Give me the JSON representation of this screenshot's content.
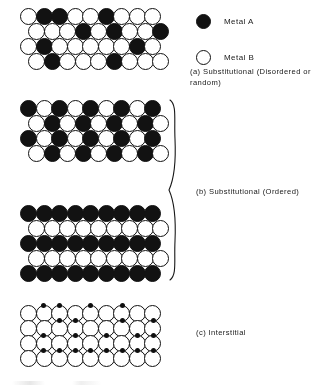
{
  "figure": {
    "colors": {
      "metal_a": "#141414",
      "metal_b": "#ffffff",
      "outline": "#111111",
      "background": "#ffffff"
    }
  },
  "legend": {
    "items": [
      {
        "label": "Metal A",
        "fill": "solid",
        "icon": "filled-circle-icon"
      },
      {
        "label": "Metal B",
        "fill": "open",
        "icon": "open-circle-icon"
      }
    ]
  },
  "captions": {
    "a": "(a) Substitutional (Disordered or random)",
    "b": "(b) Substitutional (Ordered)",
    "c": "(c) Interstitial"
  },
  "chart_data": {
    "type": "diagram",
    "blocks": [
      {
        "id": "a",
        "name": "substitutional-disordered",
        "caption": "(a) Substitutional (Disordered or random)",
        "columns": 9,
        "rows": 4,
        "offset_rows": [
          1,
          3
        ],
        "grid": [
          [
            "open",
            "dark",
            "dark",
            "open",
            "open",
            "dark",
            "open",
            "open",
            "open"
          ],
          [
            "open",
            "open",
            "open",
            "dark",
            "open",
            "dark",
            "open",
            "open",
            "dark"
          ],
          [
            "open",
            "dark",
            "open",
            "open",
            "open",
            "open",
            "open",
            "dark",
            "open"
          ],
          [
            "open",
            "dark",
            "open",
            "open",
            "open",
            "dark",
            "open",
            "open",
            "open"
          ]
        ]
      },
      {
        "id": "b1",
        "name": "substitutional-ordered-checkerboard",
        "caption": "(b) Substitutional (Ordered)",
        "columns": 9,
        "rows": 4,
        "offset_rows": [
          1,
          3
        ],
        "grid": [
          [
            "dark",
            "open",
            "dark",
            "open",
            "dark",
            "open",
            "dark",
            "open",
            "dark"
          ],
          [
            "open",
            "dark",
            "open",
            "dark",
            "open",
            "dark",
            "open",
            "dark",
            "open"
          ],
          [
            "dark",
            "open",
            "dark",
            "open",
            "dark",
            "open",
            "dark",
            "open",
            "dark"
          ],
          [
            "open",
            "dark",
            "open",
            "dark",
            "open",
            "dark",
            "open",
            "dark",
            "open"
          ]
        ]
      },
      {
        "id": "b2",
        "name": "substitutional-ordered-layered",
        "caption": "(b) Substitutional (Ordered)",
        "columns": 9,
        "rows": 5,
        "offset_rows": [
          1,
          3
        ],
        "grid": [
          [
            "dark",
            "dark",
            "dark",
            "dark",
            "dark",
            "dark",
            "dark",
            "dark",
            "dark"
          ],
          [
            "open",
            "open",
            "open",
            "open",
            "open",
            "open",
            "open",
            "open",
            "open"
          ],
          [
            "dark",
            "dark",
            "dark",
            "dark",
            "dark",
            "dark",
            "dark",
            "dark",
            "dark"
          ],
          [
            "open",
            "open",
            "open",
            "open",
            "open",
            "open",
            "open",
            "open",
            "open"
          ],
          [
            "dark",
            "dark",
            "dark",
            "dark",
            "dark",
            "dark",
            "dark",
            "dark",
            "dark"
          ]
        ]
      },
      {
        "id": "c",
        "name": "interstitial",
        "caption": "(c) Interstitial",
        "columns": 9,
        "rows": 4,
        "host_atom": "open",
        "interstitial_dots": [
          [
            2,
            4,
            8,
            12
          ],
          [
            4,
            6,
            12,
            16
          ],
          [
            2,
            6,
            10,
            14,
            16
          ],
          [
            2,
            4,
            6,
            8,
            10,
            12,
            14,
            16
          ]
        ]
      }
    ]
  }
}
